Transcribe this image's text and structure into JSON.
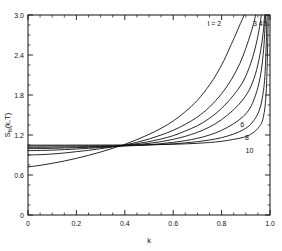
{
  "chart_data": {
    "type": "line",
    "title": "",
    "xlabel": "k",
    "ylabel": "S_N(k,T)",
    "ylabel_parts": {
      "main": "S",
      "sub": "N",
      "args": "(k,T)"
    },
    "xlim": [
      0,
      1.0
    ],
    "ylim": [
      0,
      3.0
    ],
    "xticks": [
      0,
      0.2,
      0.4,
      0.6,
      0.8,
      1.0
    ],
    "xticklabels": [
      "0",
      "0.2",
      "0.4",
      "0.6",
      "0.8",
      "1.0"
    ],
    "yticks": [
      0,
      0.6,
      1.2,
      1.8,
      2.4,
      3.0
    ],
    "yticklabels": [
      "0",
      "0.6",
      "1.2",
      "1.8",
      "2.4",
      "3.0"
    ],
    "x_minor_step": 0.05,
    "y_minor_step": 0.15,
    "grid": false,
    "legend": "inline-curve-labels",
    "parameter_name": "I",
    "series": [
      {
        "name": "I = 2",
        "label": "I = 2",
        "parameter": 2,
        "label_x": 0.77,
        "label_y": 2.88,
        "asymptote_k": 0.895,
        "x": [
          0.0,
          0.05,
          0.1,
          0.15,
          0.2,
          0.25,
          0.3,
          0.35,
          0.4,
          0.45,
          0.5,
          0.55,
          0.6,
          0.65,
          0.7,
          0.75,
          0.78,
          0.81,
          0.84,
          0.86,
          0.875,
          0.885,
          0.893
        ],
        "y": [
          0.72,
          0.745,
          0.775,
          0.81,
          0.85,
          0.895,
          0.945,
          1.0,
          1.06,
          1.13,
          1.21,
          1.3,
          1.41,
          1.55,
          1.72,
          1.95,
          2.12,
          2.32,
          2.56,
          2.72,
          2.85,
          2.93,
          3.0
        ]
      },
      {
        "name": "3",
        "label": "3",
        "parameter": 3,
        "label_x": 0.938,
        "label_y": 2.87,
        "asymptote_k": 0.945,
        "x": [
          0.0,
          0.05,
          0.1,
          0.15,
          0.2,
          0.25,
          0.3,
          0.35,
          0.4,
          0.45,
          0.5,
          0.55,
          0.6,
          0.65,
          0.7,
          0.75,
          0.8,
          0.84,
          0.875,
          0.9,
          0.92,
          0.932,
          0.941
        ],
        "y": [
          0.9,
          0.905,
          0.915,
          0.93,
          0.95,
          0.97,
          0.995,
          1.02,
          1.05,
          1.09,
          1.14,
          1.2,
          1.27,
          1.36,
          1.47,
          1.62,
          1.82,
          2.03,
          2.27,
          2.5,
          2.72,
          2.87,
          3.0
        ]
      },
      {
        "name": "4",
        "label": "4",
        "parameter": 4,
        "label_x": 0.962,
        "label_y": 2.87,
        "asymptote_k": 0.967,
        "x": [
          0.0,
          0.05,
          0.1,
          0.15,
          0.2,
          0.25,
          0.3,
          0.35,
          0.4,
          0.45,
          0.5,
          0.55,
          0.6,
          0.65,
          0.7,
          0.75,
          0.8,
          0.85,
          0.89,
          0.92,
          0.94,
          0.955,
          0.964
        ],
        "y": [
          0.965,
          0.968,
          0.973,
          0.98,
          0.99,
          1.0,
          1.012,
          1.025,
          1.045,
          1.07,
          1.1,
          1.14,
          1.19,
          1.26,
          1.34,
          1.45,
          1.6,
          1.8,
          2.01,
          2.27,
          2.52,
          2.78,
          3.0
        ]
      },
      {
        "name": "5",
        "label": "5",
        "parameter": 5,
        "label_x": 0.98,
        "label_y": 2.87,
        "asymptote_k": 0.98,
        "x": [
          0.0,
          0.05,
          0.1,
          0.15,
          0.2,
          0.25,
          0.3,
          0.35,
          0.4,
          0.45,
          0.5,
          0.55,
          0.6,
          0.65,
          0.7,
          0.75,
          0.8,
          0.85,
          0.89,
          0.92,
          0.945,
          0.962,
          0.972,
          0.978
        ],
        "y": [
          0.995,
          0.997,
          1.0,
          1.005,
          1.01,
          1.016,
          1.022,
          1.028,
          1.04,
          1.055,
          1.075,
          1.1,
          1.135,
          1.18,
          1.24,
          1.32,
          1.43,
          1.58,
          1.74,
          1.92,
          2.18,
          2.48,
          2.74,
          3.0
        ]
      },
      {
        "name": "6",
        "label": "6",
        "parameter": 6,
        "label_x": 0.885,
        "label_y": 1.355,
        "asymptote_k": 0.985,
        "x": [
          0.0,
          0.05,
          0.1,
          0.15,
          0.2,
          0.25,
          0.3,
          0.35,
          0.4,
          0.45,
          0.5,
          0.55,
          0.6,
          0.65,
          0.7,
          0.75,
          0.8,
          0.85,
          0.89,
          0.92,
          0.945,
          0.962,
          0.974,
          0.982
        ],
        "y": [
          1.015,
          1.016,
          1.018,
          1.02,
          1.022,
          1.025,
          1.027,
          1.03,
          1.035,
          1.043,
          1.055,
          1.07,
          1.09,
          1.115,
          1.15,
          1.2,
          1.27,
          1.37,
          1.48,
          1.62,
          1.85,
          2.12,
          2.5,
          3.0
        ]
      },
      {
        "name": "8",
        "label": "8",
        "parameter": 8,
        "label_x": 0.905,
        "label_y": 1.165,
        "asymptote_k": 0.9905,
        "x": [
          0.0,
          0.05,
          0.1,
          0.15,
          0.2,
          0.25,
          0.3,
          0.35,
          0.4,
          0.45,
          0.5,
          0.55,
          0.6,
          0.65,
          0.7,
          0.75,
          0.8,
          0.85,
          0.89,
          0.92,
          0.95,
          0.968,
          0.98,
          0.988
        ],
        "y": [
          1.035,
          1.035,
          1.036,
          1.036,
          1.037,
          1.038,
          1.039,
          1.04,
          1.042,
          1.045,
          1.05,
          1.058,
          1.068,
          1.082,
          1.1,
          1.125,
          1.16,
          1.215,
          1.28,
          1.36,
          1.52,
          1.75,
          2.15,
          3.0
        ]
      },
      {
        "name": "10",
        "label": "10",
        "parameter": 10,
        "label_x": 0.915,
        "label_y": 0.975,
        "asymptote_k": 0.9955,
        "x": [
          0.0,
          0.05,
          0.1,
          0.15,
          0.2,
          0.25,
          0.3,
          0.35,
          0.4,
          0.45,
          0.5,
          0.55,
          0.6,
          0.65,
          0.7,
          0.75,
          0.8,
          0.85,
          0.89,
          0.92,
          0.95,
          0.972,
          0.985,
          0.993
        ],
        "y": [
          1.048,
          1.048,
          1.048,
          1.048,
          1.049,
          1.049,
          1.05,
          1.05,
          1.051,
          1.052,
          1.054,
          1.057,
          1.061,
          1.067,
          1.075,
          1.088,
          1.105,
          1.135,
          1.165,
          1.21,
          1.3,
          1.46,
          1.9,
          3.0
        ]
      }
    ]
  }
}
